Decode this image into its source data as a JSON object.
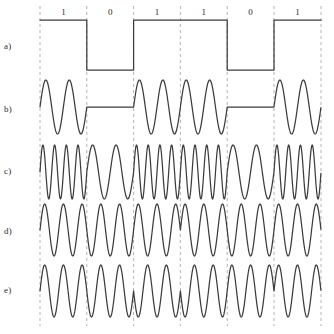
{
  "figure": {
    "width": 334,
    "height": 334,
    "background": "#ffffff",
    "wave_color": "#3c3c3c",
    "grid_color": "#b4b4b4",
    "text_color": "#2b2b2b"
  },
  "bits": {
    "sequence": [
      1,
      0,
      1,
      1,
      0,
      1
    ],
    "labels": [
      "1",
      "0",
      "1",
      "1",
      "0",
      "1"
    ],
    "label_y": 13,
    "boundaries": [
      40,
      86.8,
      133.6,
      180.4,
      227.2,
      274,
      321
    ]
  },
  "grid": {
    "x_positions": [
      40,
      86.8,
      133.6,
      180.4,
      227.2,
      274,
      321
    ],
    "y_top": 6,
    "y_bottom": 326,
    "dash": "3,3"
  },
  "rows": [
    {
      "id": "a",
      "label": "a)",
      "label_y": 47,
      "kind": "digital",
      "center_y": 45,
      "amplitude": 25,
      "high_y": 20,
      "low_y": 70
    },
    {
      "id": "b",
      "label": "b)",
      "label_y": 110,
      "kind": "ask",
      "center_y": 107,
      "amplitude": 27,
      "cycles_per_bit": 2,
      "zero_amplitude": 0
    },
    {
      "id": "c",
      "label": "c)",
      "label_y": 172,
      "kind": "fsk",
      "center_y": 172,
      "amplitude": 27,
      "cycles_one": 4,
      "cycles_zero": 2
    },
    {
      "id": "d",
      "label": "d)",
      "label_y": 232,
      "kind": "psk",
      "center_y": 230,
      "amplitude": 26,
      "cycles_per_bit": 2.5,
      "phase_one": 0,
      "phase_zero": 180
    },
    {
      "id": "e",
      "label": "e)",
      "label_y": 291,
      "kind": "dpsk",
      "center_y": 291,
      "amplitude": 26,
      "cycles_per_bit": 2.5,
      "initial_phase": 0
    }
  ],
  "chart_data": {
    "type": "line",
    "title": "",
    "xlabel": "",
    "ylabel": "",
    "categories": [
      "1",
      "0",
      "1",
      "1",
      "0",
      "1"
    ],
    "series": [
      {
        "name": "a) digital baseband",
        "values": [
          1,
          0,
          1,
          1,
          0,
          1
        ]
      },
      {
        "name": "b) ASK",
        "values": [
          1,
          0,
          1,
          1,
          0,
          1
        ]
      },
      {
        "name": "c) FSK",
        "values": [
          1,
          0,
          1,
          1,
          0,
          1
        ]
      },
      {
        "name": "d) PSK",
        "values": [
          1,
          0,
          1,
          1,
          0,
          1
        ]
      },
      {
        "name": "e) DPSK",
        "values": [
          1,
          0,
          1,
          1,
          0,
          1
        ]
      }
    ],
    "grid": true,
    "legend": "none"
  }
}
